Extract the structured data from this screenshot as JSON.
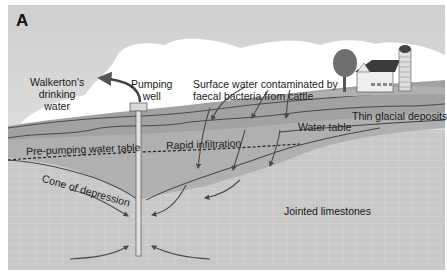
{
  "figure": {
    "panel_letter": "A",
    "labels": {
      "drinking_water": [
        "Walkerton's",
        "drinking",
        "water"
      ],
      "pumping_well": [
        "Pumping",
        "well"
      ],
      "surface_water": [
        "Surface water contaminated by",
        "faecal bacteria from cattle"
      ],
      "thin_glacial_deposits": "Thin glacial deposits",
      "water_table": "Water table",
      "pre_pumping_water_table": "Pre-pumping water table",
      "rapid_infiltration": "Rapid infiltration",
      "cone_of_depression": "Cone of depression",
      "jointed_limestones": "Jointed limestones"
    },
    "elements": {
      "well": "pumping-well",
      "farm": [
        "tree",
        "barn",
        "silo"
      ],
      "cloud": "cloud"
    },
    "colors": {
      "sky_top": "#d8d8d8",
      "sky_bottom": "#eeeeee",
      "cloud": "#ffffff",
      "glacial_deposit": "#a9a9a9",
      "saturated_zone": "#b5b5b5",
      "limestone": "#c9c9c9",
      "arrow": "#4a4a4a",
      "line": "#333333"
    }
  }
}
